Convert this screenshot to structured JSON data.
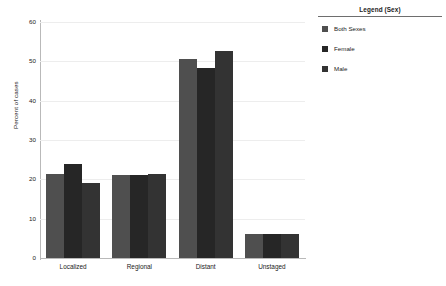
{
  "chart_data": {
    "type": "bar",
    "title": "",
    "xlabel": "",
    "ylabel": "Percent of cases",
    "ylim": [
      0,
      60
    ],
    "yticks": [
      0,
      10,
      20,
      30,
      40,
      50,
      60
    ],
    "grid": true,
    "legend_position": "right",
    "categories": [
      "Localized",
      "Regional",
      "Distant",
      "Unstaged"
    ],
    "series": [
      {
        "name": "Both Sexes",
        "color": "#4f4f4f",
        "values": [
          21.3,
          21.2,
          50.7,
          6.2
        ]
      },
      {
        "name": "Female",
        "color": "#262626",
        "values": [
          23.8,
          21.0,
          48.3,
          6.2
        ]
      },
      {
        "name": "Male",
        "color": "#333333",
        "values": [
          19.1,
          21.3,
          52.7,
          6.2
        ]
      }
    ]
  },
  "legend": {
    "title": "Legend (Sex)"
  },
  "axes": {
    "y_title": "Percent of cases"
  }
}
